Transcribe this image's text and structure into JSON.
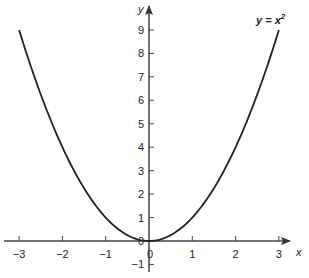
{
  "chart_data": {
    "type": "line",
    "title": "",
    "xlabel": "x",
    "ylabel": "y",
    "xlim": [
      -3.3,
      3.4
    ],
    "ylim": [
      -1.4,
      9.6
    ],
    "grid": false,
    "x_ticks": [
      -3,
      -2,
      -1,
      0,
      1,
      2,
      3
    ],
    "x_tick_labels": [
      "−3",
      "−2",
      "−1",
      "0",
      "1",
      "2",
      "3"
    ],
    "y_ticks": [
      -1,
      1,
      2,
      3,
      4,
      5,
      6,
      7,
      8,
      9
    ],
    "y_tick_labels": [
      "−1",
      "1",
      "2",
      "3",
      "4",
      "5",
      "6",
      "7",
      "8",
      "9"
    ],
    "series": [
      {
        "name": "y = x²",
        "x": [
          -3,
          -2.5,
          -2,
          -1.5,
          -1,
          -0.5,
          0,
          0.5,
          1,
          1.5,
          2,
          2.5,
          3
        ],
        "values": [
          9,
          6.25,
          4,
          2.25,
          1,
          0.25,
          0,
          0.25,
          1,
          2.25,
          4,
          6.25,
          9
        ]
      }
    ],
    "annotations": [
      {
        "text": "y = x²",
        "position": "top-right near curve end"
      }
    ],
    "origin_label": "0",
    "curve_color": "#222222",
    "axis_color": "#444444"
  },
  "labels": {
    "x_axis": "x",
    "y_axis": "y",
    "curve_base": "y = x",
    "curve_exp": "2",
    "origin": "0"
  }
}
